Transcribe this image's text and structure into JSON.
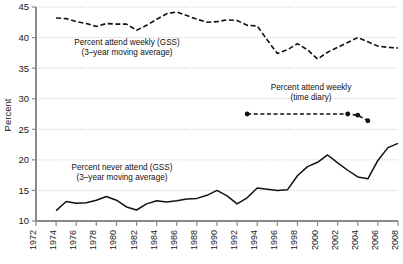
{
  "chart_data": {
    "type": "line",
    "title": "",
    "xlabel": "",
    "ylabel": "Percent",
    "xlim": [
      1972,
      2008
    ],
    "ylim": [
      10,
      45
    ],
    "grid": true,
    "grid_axis": "y",
    "legend_position": "inline-annotations",
    "y_ticks": [
      10,
      15,
      20,
      25,
      30,
      35,
      40,
      45
    ],
    "x_ticks": [
      1972,
      1974,
      1976,
      1978,
      1980,
      1982,
      1984,
      1986,
      1988,
      1990,
      1992,
      1994,
      1996,
      1998,
      2000,
      2002,
      2004,
      2006,
      2008
    ],
    "series": [
      {
        "name": "Percent attend weekly (GSS)",
        "note": "3-year moving average",
        "style": "dashed",
        "color": "#111111",
        "x": [
          1974,
          1975,
          1976,
          1977,
          1978,
          1979,
          1980,
          1981,
          1982,
          1983,
          1984,
          1985,
          1986,
          1987,
          1988,
          1989,
          1990,
          1991,
          1992,
          1993,
          1994,
          1995,
          1996,
          1997,
          1998,
          1999,
          2000,
          2001,
          2002,
          2003,
          2004,
          2005,
          2006,
          2007,
          2008
        ],
        "values": [
          43.2,
          43.1,
          42.6,
          42.3,
          41.8,
          42.3,
          42.2,
          42.2,
          41.2,
          42.0,
          43.0,
          43.9,
          44.2,
          43.6,
          43.0,
          42.5,
          42.6,
          42.9,
          42.8,
          42.0,
          41.9,
          39.6,
          37.4,
          38.0,
          39.0,
          38.0,
          36.5,
          37.6,
          38.4,
          39.2,
          40.0,
          39.3,
          38.6,
          38.4,
          38.3
        ]
      },
      {
        "name": "Percent attend weekly (time diary)",
        "note": "time diary",
        "style": "dashed-with-markers",
        "color": "#111111",
        "x": [
          1993,
          2003,
          2004,
          2005
        ],
        "values": [
          27.5,
          27.5,
          27.3,
          26.4
        ]
      },
      {
        "name": "Percent never attend (GSS)",
        "note": "3-year moving average",
        "style": "solid",
        "color": "#111111",
        "x": [
          1974,
          1975,
          1976,
          1977,
          1978,
          1979,
          1980,
          1981,
          1982,
          1983,
          1984,
          1985,
          1986,
          1987,
          1988,
          1989,
          1990,
          1991,
          1992,
          1993,
          1994,
          1995,
          1996,
          1997,
          1998,
          1999,
          2000,
          2001,
          2002,
          2003,
          2004,
          2005,
          2006,
          2007,
          2008
        ],
        "values": [
          11.7,
          13.2,
          12.9,
          13.0,
          13.4,
          14.0,
          13.4,
          12.3,
          11.8,
          12.8,
          13.3,
          13.1,
          13.3,
          13.6,
          13.7,
          14.2,
          15.0,
          14.1,
          12.8,
          13.8,
          15.4,
          15.2,
          15.0,
          15.1,
          17.4,
          18.9,
          19.6,
          20.8,
          19.5,
          18.3,
          17.2,
          16.9,
          19.9,
          22.0,
          22.7
        ]
      }
    ],
    "annotations": [
      {
        "id": "annot-weekly-gss",
        "line1": "Percent attend weekly (GSS)",
        "line2": "(3–year moving average)",
        "x_px": 127,
        "y_px": 45
      },
      {
        "id": "annot-time-diary",
        "line1": "Percent attend weekly",
        "line2": "(time diary)",
        "x_px": 311,
        "y_px": 90
      },
      {
        "id": "annot-never-gss",
        "line1": "Percent never attend (GSS)",
        "line2": "(3–year moving average)",
        "x_px": 122,
        "y_px": 170
      }
    ]
  }
}
